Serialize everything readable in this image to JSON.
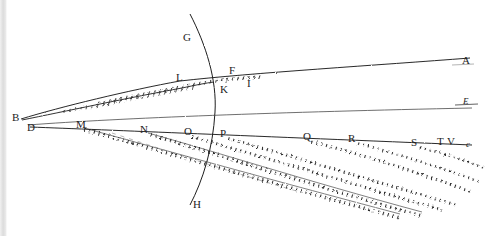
{
  "figure": {
    "background_color": "#ffffff",
    "ink_color": "#1d1d1d",
    "width": 490,
    "height": 236
  },
  "labels": [
    {
      "id": "A",
      "text": "A",
      "x": 462,
      "y": 61,
      "size": "normal",
      "style": "roman"
    },
    {
      "id": "B",
      "text": "B",
      "x": 12,
      "y": 113,
      "size": "normal",
      "style": "roman"
    },
    {
      "id": "D",
      "text": "D",
      "x": 27,
      "y": 123,
      "size": "normal",
      "style": "roman"
    },
    {
      "id": "E",
      "text": "E",
      "x": 463,
      "y": 100,
      "size": "small",
      "style": "italic"
    },
    {
      "id": "F",
      "text": "F",
      "x": 229,
      "y": 70,
      "size": "normal",
      "style": "roman"
    },
    {
      "id": "G",
      "text": "G",
      "x": 183,
      "y": 33,
      "size": "normal",
      "style": "roman"
    },
    {
      "id": "H",
      "text": "H",
      "x": 192,
      "y": 199,
      "size": "normal",
      "style": "roman"
    },
    {
      "id": "I",
      "text": "I",
      "x": 246,
      "y": 81,
      "size": "normal",
      "style": "roman"
    },
    {
      "id": "K",
      "text": "K",
      "x": 223,
      "y": 87,
      "size": "normal",
      "style": "roman"
    },
    {
      "id": "L",
      "text": "L",
      "x": 176,
      "y": 76,
      "size": "normal",
      "style": "roman"
    },
    {
      "id": "M",
      "text": "M",
      "x": 76,
      "y": 121,
      "size": "normal",
      "style": "roman"
    },
    {
      "id": "N",
      "text": "N",
      "x": 140,
      "y": 127,
      "size": "normal",
      "style": "roman"
    },
    {
      "id": "O",
      "text": "O",
      "x": 183,
      "y": 129,
      "size": "normal",
      "style": "roman"
    },
    {
      "id": "P",
      "text": "P",
      "x": 219,
      "y": 131,
      "size": "normal",
      "style": "roman"
    },
    {
      "id": "Q",
      "text": "Q",
      "x": 303,
      "y": 134,
      "size": "normal",
      "style": "roman"
    },
    {
      "id": "R",
      "text": "R",
      "x": 348,
      "y": 136,
      "size": "normal",
      "style": "roman"
    },
    {
      "id": "S",
      "text": "S",
      "x": 411,
      "y": 140,
      "size": "normal",
      "style": "roman"
    },
    {
      "id": "T",
      "text": "T",
      "x": 437,
      "y": 139,
      "size": "normal",
      "style": "roman"
    },
    {
      "id": "V",
      "text": "V",
      "x": 448,
      "y": 139,
      "size": "normal",
      "style": "roman"
    },
    {
      "id": "c",
      "text": "c",
      "x": 466,
      "y": 142,
      "size": "small",
      "style": "italic"
    }
  ],
  "geometry": {
    "arc_GKH": "M 190 14 C 206 45, 217 80, 215 112 C 213 148, 203 180, 190 205",
    "upper_ray_BA": "M 21 119 C 60 107, 130 90, 180 81 C 250 73, 380 65, 470 58",
    "upper_band_edge": "M 23 121 C 62 111, 132 95, 182 86 C 240 79, 300 74, 350 70",
    "axis_DE": "M 28 125 C 120 118, 280 112, 470 108",
    "base_line_Dc": "M 30 127 C 110 130, 250 136, 470 145",
    "fan_rays": [
      {
        "from": "M",
        "path": "M 84 129 C 150 148, 260 180, 400 218"
      },
      {
        "from": "N",
        "path": "M 148 134 C 210 152, 300 182, 420 216"
      },
      {
        "from": "O",
        "path": "M 190 136 C 250 153, 330 178, 440 210"
      },
      {
        "from": "P",
        "path": "M 226 138 C 285 154, 360 178, 455 205"
      },
      {
        "from": "Q",
        "path": "M 310 141 C 355 153, 410 170, 470 192"
      },
      {
        "from": "R",
        "path": "M 356 143 C 396 153, 435 166, 478 182"
      },
      {
        "from": "S",
        "path": "M 418 147 C 443 153, 463 160, 482 168"
      }
    ]
  }
}
